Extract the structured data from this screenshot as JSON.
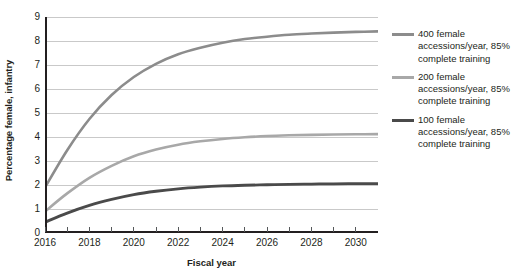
{
  "chart_data": {
    "type": "line",
    "title": "",
    "xlabel": "Fiscal year",
    "ylabel": "Percentage female, infantry",
    "xlim": [
      2016,
      2031
    ],
    "ylim": [
      0,
      9
    ],
    "ytick_labels": [
      "0",
      "1",
      "2",
      "3",
      "4",
      "5",
      "6",
      "7",
      "8",
      "9"
    ],
    "ytick_values": [
      0,
      1,
      2,
      3,
      4,
      5,
      6,
      7,
      8,
      9
    ],
    "xtick_labels": [
      "2016",
      "2018",
      "2020",
      "2022",
      "2024",
      "2026",
      "2028",
      "2030"
    ],
    "xtick_values": [
      2016,
      2018,
      2020,
      2022,
      2024,
      2026,
      2028,
      2030
    ],
    "x_minor_ticks": [
      2017,
      2019,
      2021,
      2023,
      2025,
      2027,
      2029,
      2031
    ],
    "grid": "horizontal",
    "legend_position": "right",
    "x": [
      2016,
      2017,
      2018,
      2019,
      2020,
      2021,
      2022,
      2023,
      2024,
      2025,
      2026,
      2027,
      2028,
      2029,
      2030,
      2031
    ],
    "series": [
      {
        "name": "400 female accessions/year, 85% complete training",
        "color": "#8c8c8c",
        "width": 2.6,
        "values": [
          1.9,
          3.45,
          4.75,
          5.75,
          6.5,
          7.05,
          7.45,
          7.72,
          7.93,
          8.08,
          8.18,
          8.26,
          8.31,
          8.35,
          8.38,
          8.4
        ]
      },
      {
        "name": "200 female accessions/year, 85% complete training",
        "color": "#a8a8a8",
        "width": 2.6,
        "values": [
          0.9,
          1.65,
          2.3,
          2.8,
          3.2,
          3.48,
          3.68,
          3.82,
          3.92,
          3.99,
          4.04,
          4.07,
          4.09,
          4.105,
          4.115,
          4.12
        ]
      },
      {
        "name": "100 female accessions/year, 85% complete training",
        "color": "#4a4a4a",
        "width": 2.8,
        "values": [
          0.45,
          0.83,
          1.15,
          1.4,
          1.6,
          1.74,
          1.84,
          1.91,
          1.96,
          1.99,
          2.01,
          2.03,
          2.04,
          2.05,
          2.055,
          2.06
        ]
      }
    ]
  },
  "legend": {
    "items": [
      {
        "label": "400 female accessions/year, 85% complete training"
      },
      {
        "label": "200 female accessions/year, 85% complete training"
      },
      {
        "label": "100 female accessions/year, 85% complete training"
      }
    ]
  },
  "colors": {
    "axis": "#231f20",
    "grid": "#c9c9c9",
    "text": "#231f20",
    "series_400": "#8c8c8c",
    "series_200": "#a8a8a8",
    "series_100": "#4a4a4a"
  }
}
